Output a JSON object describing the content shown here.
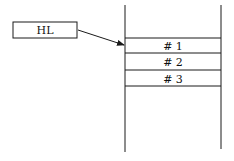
{
  "diagram": {
    "type": "stack-pointer",
    "pointer": {
      "label": "HL",
      "points_to": "# 1"
    },
    "stack": {
      "entries": [
        {
          "label": "# 1"
        },
        {
          "label": "# 2"
        },
        {
          "label": "# 3"
        }
      ]
    },
    "colors": {
      "line": "#1a1a1a",
      "background": "#ffffff"
    }
  }
}
